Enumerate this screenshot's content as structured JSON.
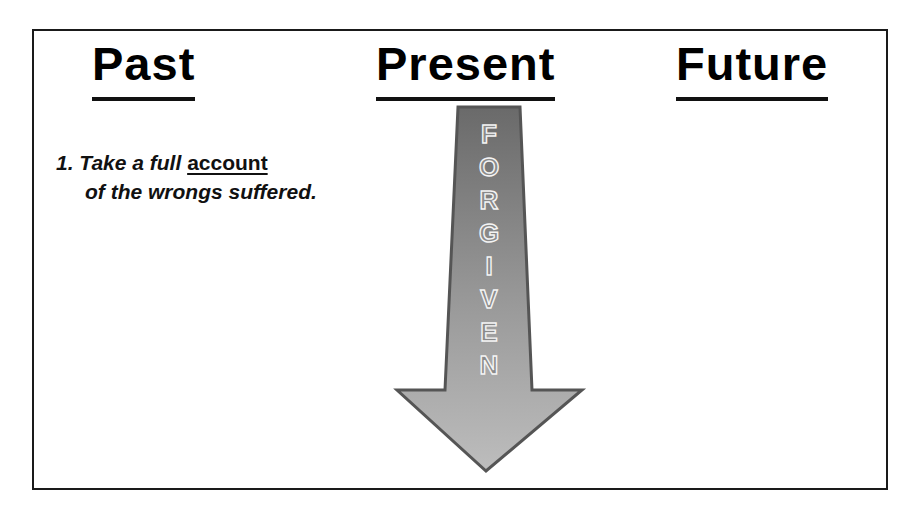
{
  "slide": {
    "headings": {
      "past": "Past",
      "present": "Present",
      "future": "Future"
    },
    "points": [
      {
        "number": "1.",
        "before": "Take a full",
        "keyword": "account",
        "after": "of the wrongs suffered."
      }
    ],
    "arrow": {
      "label_letters": [
        "F",
        "O",
        "R",
        "G",
        "I",
        "V",
        "E",
        "N"
      ],
      "label": "FORGIVEN",
      "direction": "down",
      "colors": {
        "top": "#6e6e6e",
        "bottom": "#b4b4b4",
        "outline": "#555555"
      }
    }
  }
}
